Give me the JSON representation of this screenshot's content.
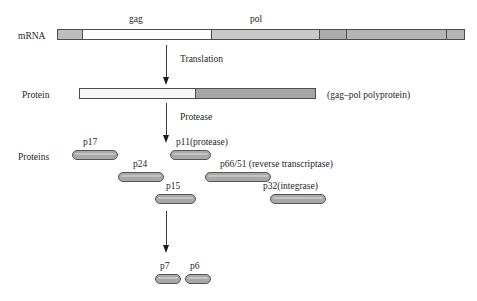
{
  "figure": {
    "colors": {
      "gag_fill": "#ffffff",
      "pol_fill_light": "#c9c9c9",
      "pol_fill_mid": "#b0b0b0",
      "pol_fill_dark": "#9e9e9e",
      "pill_fill": "#a8a8a8",
      "outline": "#4d4d4d",
      "text": "#262626",
      "arrow": "#1c1c1c"
    }
  },
  "rows": {
    "mrna": {
      "label": "mRNA",
      "gene_labels": [
        {
          "text": "gag"
        },
        {
          "text": "pol"
        }
      ]
    },
    "protein": {
      "label": "Protein",
      "annotation": "(gag–pol polyprotein)"
    },
    "proteins": {
      "label": "Proteins"
    }
  },
  "arrows": [
    {
      "name": "translation",
      "label": "Translation"
    },
    {
      "name": "protease",
      "label": "Protease"
    },
    {
      "name": "cleavage",
      "label": ""
    }
  ],
  "products": [
    {
      "id": "p17",
      "label": "p17"
    },
    {
      "id": "p11",
      "label": "p11(protease)"
    },
    {
      "id": "p24",
      "label": "p24"
    },
    {
      "id": "p66_51",
      "label": "p66/51 (reverse transcriptase)"
    },
    {
      "id": "p15",
      "label": "p15"
    },
    {
      "id": "p32",
      "label": "p32(integrase)"
    },
    {
      "id": "p7",
      "label": "p7"
    },
    {
      "id": "p6",
      "label": "p6"
    }
  ]
}
